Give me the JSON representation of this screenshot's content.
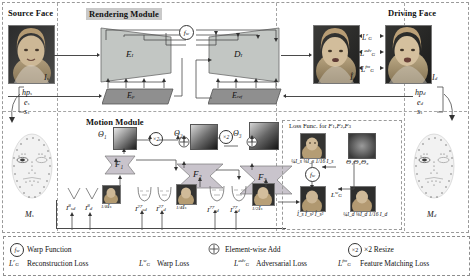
{
  "figure": {
    "type": "architecture-diagram",
    "panels": {
      "source_face_title": "Source Face",
      "rendering_module_title": "Rendering Module",
      "driving_face_title": "Driving Face",
      "motion_module_title": "Motion Module",
      "loss_func_title": "Loss Func. for F₁,F₂,F₃"
    },
    "rendering": {
      "encoder_f": "E",
      "encoder_f_sub": "I",
      "decoder_f": "D",
      "decoder_f_sub": "I",
      "encoder_p": "E",
      "encoder_p_sub": "p",
      "encoder_ref": "E",
      "encoder_ref_sub": "ref",
      "warp_symbol": "f",
      "warp_symbol_sub": "w"
    },
    "images": {
      "source_label": "I",
      "source_sub": "s",
      "generated_label": "Î",
      "generated_sub": "d",
      "driving_label": "I",
      "driving_sub": "d"
    },
    "source_params": {
      "hp": "hp",
      "hp_sub": "s",
      "e": "e",
      "e_sub": "s",
      "s": "s",
      "s_sub": "s",
      "mesh": "M",
      "mesh_sub": "s"
    },
    "driving_params": {
      "hp": "hp",
      "hp_sub": "d",
      "e": "e",
      "e_sub": "d",
      "s": "s",
      "s_sub": "s",
      "mesh": "M",
      "mesh_sub": "d"
    },
    "losses_on_output": [
      {
        "sym": "L",
        "sub": "G",
        "sup": "r"
      },
      {
        "sym": "L",
        "sub": "G",
        "sup": "adv"
      },
      {
        "sym": "L",
        "sub": "G",
        "sup": "fm"
      }
    ],
    "motion": {
      "flow_blocks": [
        "F₁",
        "F₂",
        "F₃"
      ],
      "theta_blocks": [
        "Θ₁",
        "Θ₂",
        "Θ₃"
      ],
      "resize_label": "×2",
      "add_label": "+",
      "inputs_group1": [
        {
          "sym": "I",
          "sub": "sd",
          "sup": "8"
        },
        {
          "sym": "I",
          "sub": "d",
          "sup": "8"
        },
        {
          "sym": "I",
          "sub": "s",
          "frac": "1/8"
        }
      ],
      "inputs_group2": [
        {
          "sym": "I",
          "sub": "sd",
          "sup": "27"
        },
        {
          "sym": "I",
          "sub": "d",
          "sup": "27"
        },
        {
          "sym": "I",
          "sub": "s",
          "frac": "1/4"
        }
      ],
      "inputs_group3": [
        {
          "sym": "I",
          "sub": "sd",
          "sup": "77"
        },
        {
          "sym": "I",
          "sub": "d",
          "sup": "77"
        },
        {
          "sym": "I",
          "sub": "s",
          "frac": "1/2"
        }
      ]
    },
    "loss_box": {
      "top_row_label": "¼I_s ⅛I_s 1/16 I_s",
      "theta_row": "Θ₁Θ₂Θ₃",
      "warp_symbol": "f",
      "warp_symbol_sub": "w",
      "warp_loss": {
        "sym": "L",
        "sub": "G",
        "sup": "w"
      },
      "bottom_left_label": "Î_s Î_s² Î_s³",
      "bottom_right_label": "¼I_d ⅛I_d 1/16 I_d"
    },
    "legend": [
      {
        "icon": "warp-function-icon",
        "sym": "f",
        "sub": "w",
        "label": "Warp Function"
      },
      {
        "icon": "element-wise-add-icon",
        "sym": "⊕",
        "sub": "",
        "label": "Element-wise Add"
      },
      {
        "icon": "resize-icon",
        "sym": "×2",
        "sub": "",
        "label": "×2 Resize"
      },
      {
        "icon": "reconstruction-loss-icon",
        "sym": "L",
        "sub": "G",
        "sup": "r",
        "label": "Reconstruction Loss"
      },
      {
        "icon": "warp-loss-icon",
        "sym": "L",
        "sub": "G",
        "sup": "w",
        "label": "Warp Loss"
      },
      {
        "icon": "adversarial-loss-icon",
        "sym": "L",
        "sub": "G",
        "sup": "adv",
        "label": "Adversarial Loss"
      },
      {
        "icon": "feature-matching-loss-icon",
        "sym": "L",
        "sub": "G",
        "sup": "fm",
        "label": "Feature Matching Loss"
      }
    ],
    "colors": {
      "encoder_fill": "#c2c6c3",
      "encoder_dark_fill": "#8f8f8f",
      "flow_fill": "#c9c4cc",
      "line": "#4a4a4a",
      "dash": "#9a9a9a",
      "title_highlight": "#c9c9c9"
    }
  }
}
